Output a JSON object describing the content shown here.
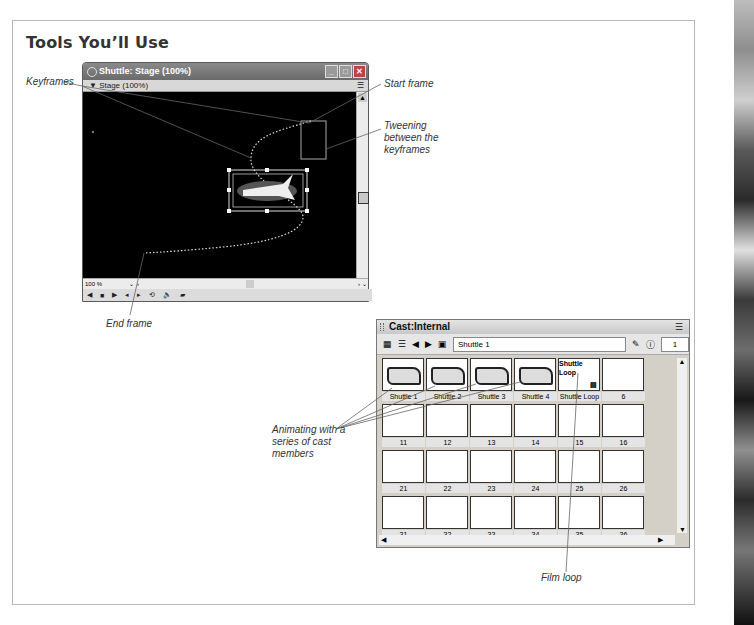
{
  "heading": "Tools You’ll Use",
  "callouts": {
    "keyframes": "Keyframes",
    "start_frame": "Start frame",
    "tweening": "Tweening between the keyframes",
    "end_frame": "End frame",
    "animating": "Animating with a series of cast members",
    "film_loop": "Film loop"
  },
  "stage_window": {
    "title": "Shuttle: Stage (100%)",
    "subtitle": "▼ Stage (100%)",
    "zoom": "100 %",
    "buttons": [
      "minimize",
      "maximize",
      "close"
    ],
    "controls": [
      "rewind",
      "stop",
      "play",
      "step-back",
      "step-forward",
      "loop",
      "volume",
      "camera"
    ]
  },
  "cast_window": {
    "title": "Cast:Internal",
    "member_name": "Shuttle 1",
    "member_number": "1",
    "cells": [
      {
        "label": "Shuttle 1",
        "type": "bitmap"
      },
      {
        "label": "Shuttle 2",
        "type": "bitmap"
      },
      {
        "label": "Shuttle 3",
        "type": "bitmap"
      },
      {
        "label": "Shuttle 4",
        "type": "bitmap"
      },
      {
        "label": "Shuttle Loop",
        "type": "filmloop",
        "inner": "Shuttle Loop"
      },
      {
        "label": "6",
        "type": "empty"
      },
      {
        "label": "11"
      },
      {
        "label": "12"
      },
      {
        "label": "13"
      },
      {
        "label": "14"
      },
      {
        "label": "15"
      },
      {
        "label": "16"
      },
      {
        "label": "21"
      },
      {
        "label": "22"
      },
      {
        "label": "23"
      },
      {
        "label": "24"
      },
      {
        "label": "25"
      },
      {
        "label": "26"
      },
      {
        "label": "31"
      },
      {
        "label": "32"
      },
      {
        "label": "33"
      },
      {
        "label": "34"
      },
      {
        "label": "35"
      },
      {
        "label": "36"
      }
    ]
  }
}
